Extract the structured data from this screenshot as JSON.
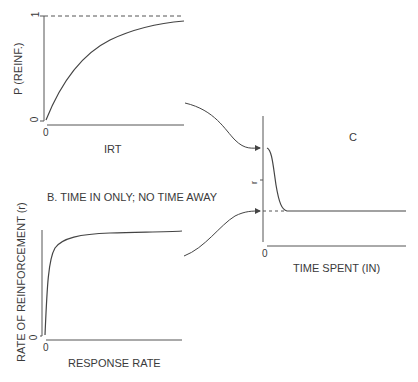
{
  "panel_a": {
    "y_label": "P (REINF.)",
    "x_label": "IRT",
    "y_tick_top": "1",
    "y_tick_zero": "0",
    "x_tick_zero": "0"
  },
  "panel_b": {
    "title": "B. TIME IN ONLY; NO TIME AWAY",
    "y_label": "RATE OF REINFORCEMENT (r)",
    "x_label": "RESPONSE RATE",
    "y_tick_zero": "0",
    "x_tick_zero": "0"
  },
  "panel_c": {
    "title": "C",
    "y_label": "r",
    "x_label": "TIME SPENT (IN)",
    "x_tick_zero": "0"
  },
  "colors": {
    "line": "#444444",
    "text": "#3a3a3a",
    "background": "#ffffff"
  }
}
